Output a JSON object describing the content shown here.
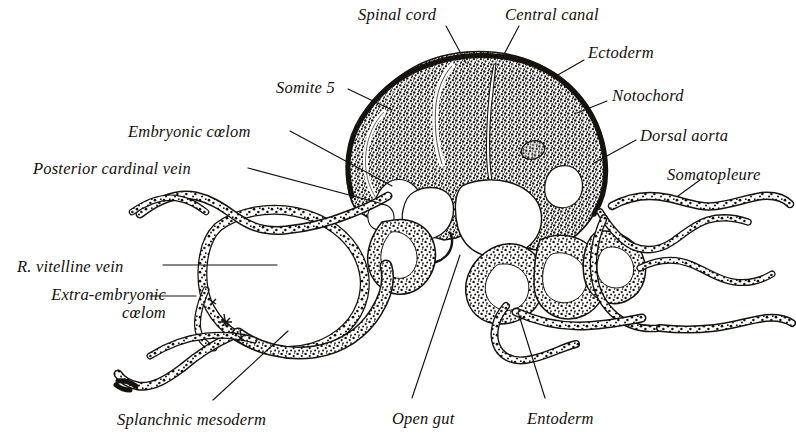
{
  "figure": {
    "kind": "embryology-cross-section-plate",
    "background_color": "#ffffff",
    "ink_color": "#14100c",
    "width": 796,
    "height": 439
  },
  "labels": [
    {
      "id": "spinal-cord",
      "text": "Spinal cord",
      "x": 358,
      "y": 6,
      "align": "left"
    },
    {
      "id": "central-canal",
      "text": "Central canal",
      "x": 505,
      "y": 6,
      "align": "left"
    },
    {
      "id": "ectoderm",
      "text": "Ectoderm",
      "x": 588,
      "y": 44,
      "align": "left"
    },
    {
      "id": "notochord",
      "text": "Notochord",
      "x": 612,
      "y": 87,
      "align": "left"
    },
    {
      "id": "somite-5",
      "text": "Somite 5",
      "x": 276,
      "y": 79,
      "align": "left"
    },
    {
      "id": "embryonic-coelom",
      "text": "Embryonic cœlom",
      "x": 128,
      "y": 123,
      "align": "left"
    },
    {
      "id": "posterior-cardinal-vein",
      "text": "Posterior cardinal vein",
      "x": 33,
      "y": 160,
      "align": "left"
    },
    {
      "id": "dorsal-aorta",
      "text": "Dorsal aorta",
      "x": 640,
      "y": 127,
      "align": "left"
    },
    {
      "id": "somatopleure",
      "text": "Somatopleure",
      "x": 667,
      "y": 166,
      "align": "left"
    },
    {
      "id": "r-vitelline-vein",
      "text": "R. vitelline vein",
      "x": 17,
      "y": 258,
      "align": "left"
    },
    {
      "id": "extra-embryonic-coelom",
      "text": "Extra-embryonic\ncœlom",
      "x": 6,
      "y": 286,
      "align": "right"
    },
    {
      "id": "splanchnic-mesoderm",
      "text": "Splanchnic mesoderm",
      "x": 117,
      "y": 411,
      "align": "left"
    },
    {
      "id": "open-gut",
      "text": "Open gut",
      "x": 392,
      "y": 410,
      "align": "left"
    },
    {
      "id": "entoderm",
      "text": "Entoderm",
      "x": 527,
      "y": 410,
      "align": "left"
    }
  ],
  "leader_lines": [
    {
      "id": "leader-spinal-cord",
      "from": [
        446,
        26
      ],
      "to": [
        466,
        63
      ]
    },
    {
      "id": "leader-central-canal",
      "from": [
        519,
        26
      ],
      "to": [
        501,
        60
      ]
    },
    {
      "id": "leader-ectoderm",
      "from": [
        584,
        60
      ],
      "to": [
        556,
        76
      ]
    },
    {
      "id": "leader-notochord",
      "from": [
        607,
        101
      ],
      "to": [
        577,
        113
      ]
    },
    {
      "id": "leader-somite-5",
      "from": [
        348,
        89
      ],
      "to": [
        392,
        110
      ]
    },
    {
      "id": "leader-embryonic-coelom",
      "from": [
        290,
        131
      ],
      "to": [
        392,
        186
      ]
    },
    {
      "id": "leader-posterior-cardinal-vein",
      "from": [
        248,
        168
      ],
      "to": [
        383,
        204
      ]
    },
    {
      "id": "leader-dorsal-aorta",
      "from": [
        636,
        140
      ],
      "to": [
        594,
        163
      ]
    },
    {
      "id": "leader-somatopleure",
      "from": [
        700,
        180
      ],
      "to": [
        678,
        196
      ]
    },
    {
      "id": "leader-r-vitelline-vein",
      "from": [
        163,
        265
      ],
      "to": [
        277,
        265
      ]
    },
    {
      "id": "leader-extra-embryonic-coelom",
      "from": [
        150,
        296
      ],
      "to": [
        196,
        296
      ]
    },
    {
      "id": "leader-splanchnic-mesoderm",
      "from": [
        213,
        400
      ],
      "to": [
        288,
        331
      ]
    },
    {
      "id": "leader-open-gut",
      "from": [
        412,
        398
      ],
      "to": [
        460,
        255
      ]
    },
    {
      "id": "leader-entoderm",
      "from": [
        545,
        398
      ],
      "to": [
        518,
        312
      ]
    }
  ]
}
